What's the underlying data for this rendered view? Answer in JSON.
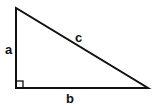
{
  "diagram": {
    "type": "right-triangle",
    "labels": {
      "side_a": "a",
      "side_b": "b",
      "hypotenuse_c": "c"
    },
    "stroke_color": "#111111",
    "background": "#ffffff"
  }
}
